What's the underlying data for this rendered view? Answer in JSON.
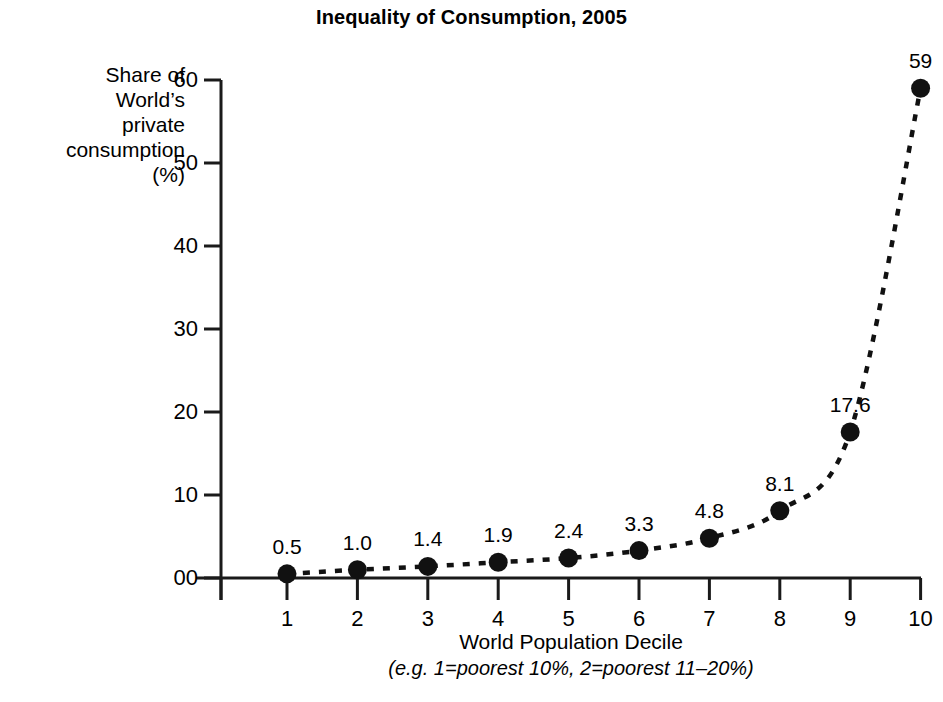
{
  "chart_data": {
    "type": "line",
    "title": "Inequality of Consumption, 2005",
    "xlabel": "World Population Decile",
    "xlabel_note": "(e.g. 1=poorest 10%, 2=poorest 11–20%)",
    "ylabel": "Share of\nWorld’s\nprivate\nconsumption\n(%)",
    "categories": [
      1,
      2,
      3,
      4,
      5,
      6,
      7,
      8,
      9,
      10
    ],
    "x_tick_labels": [
      "1",
      "2",
      "3",
      "4",
      "5",
      "6",
      "7",
      "8",
      "9",
      "10"
    ],
    "values": [
      0.5,
      1.0,
      1.4,
      1.9,
      2.4,
      3.3,
      4.8,
      8.1,
      17.6,
      59
    ],
    "point_labels": [
      "0.5",
      "1.0",
      "1.4",
      "1.9",
      "2.4",
      "3.3",
      "4.8",
      "8.1",
      "17.6",
      "59"
    ],
    "y_tick_labels": [
      "60",
      "50",
      "40",
      "30",
      "20",
      "10",
      "00"
    ],
    "y_tick_values": [
      60,
      50,
      40,
      30,
      20,
      10,
      0
    ],
    "ylim": [
      0,
      60
    ],
    "xlim": [
      0.06,
      10
    ],
    "grid": false,
    "legend": null,
    "line_style": "dashed",
    "marker": "filled-circle",
    "series_color": "#111111",
    "axis_color": "#1a1a1a",
    "background_color": "#ffffff"
  }
}
